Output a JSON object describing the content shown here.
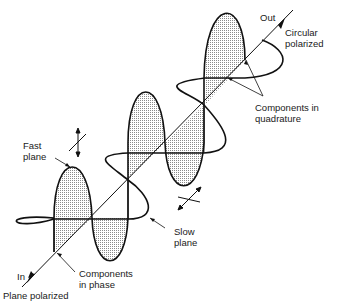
{
  "labels": {
    "out": "Out",
    "circular_1": "Circular",
    "circular_2": "polarized",
    "quadrature_1": "Components in",
    "quadrature_2": "quadrature",
    "fast_1": "Fast",
    "fast_2": "plane",
    "slow_1": "Slow",
    "slow_2": "plane",
    "in": "In",
    "phase_1": "Components",
    "phase_2": "in phase",
    "plane_polarized": "Plane polarized"
  },
  "colors": {
    "line": "#111111",
    "shade": "#c8c8c8",
    "background": "#ffffff"
  },
  "icons": [
    "input-arrow-icon",
    "output-arrow-icon",
    "fast-axis-symbol-icon",
    "slow-axis-symbol-icon"
  ]
}
